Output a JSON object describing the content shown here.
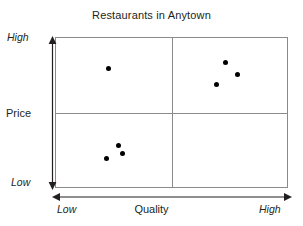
{
  "chart_data": {
    "type": "scatter",
    "title": "Restaurants in Anytown",
    "xlabel": "Quality",
    "ylabel": "Price",
    "x_tick_low": "Low",
    "x_tick_high": "High",
    "y_tick_low": "Low",
    "y_tick_high": "High",
    "xlim": [
      0,
      100
    ],
    "ylim": [
      0,
      100
    ],
    "grid": false,
    "legend": "none",
    "quadrant_dividers": {
      "x": 50,
      "y": 50
    },
    "line_color": "#8a8a8a",
    "point_color": "#000000",
    "text_color": "#231f20",
    "points": [
      {
        "name": "point-1",
        "x": 22.7,
        "y": 79.5,
        "quadrant": "high-price-low-quality"
      },
      {
        "name": "point-2",
        "x": 73.4,
        "y": 83.4,
        "quadrant": "high-price-high-quality"
      },
      {
        "name": "point-3",
        "x": 78.5,
        "y": 75.5,
        "quadrant": "high-price-high-quality"
      },
      {
        "name": "point-4",
        "x": 69.5,
        "y": 68.9,
        "quadrant": "high-price-high-quality"
      },
      {
        "name": "point-5",
        "x": 27.0,
        "y": 27.8,
        "quadrant": "low-price-low-quality"
      },
      {
        "name": "point-6",
        "x": 28.8,
        "y": 22.5,
        "quadrant": "low-price-low-quality"
      },
      {
        "name": "point-7",
        "x": 21.9,
        "y": 19.2,
        "quadrant": "low-price-low-quality"
      }
    ]
  }
}
